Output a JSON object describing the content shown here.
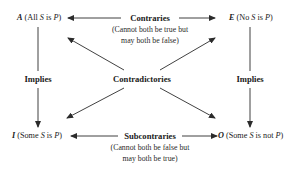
{
  "diagram": {
    "corners": {
      "A": {
        "letter": "A",
        "open": " (All ",
        "s": "S",
        "mid": " is ",
        "p": "P",
        "close": ")"
      },
      "E": {
        "letter": "E",
        "open": " (No ",
        "s": "S",
        "mid": " is ",
        "p": "P",
        "close": ")"
      },
      "I": {
        "letter": "I",
        "open": " (Some ",
        "s": "S",
        "mid": " is ",
        "p": "P",
        "close": ")"
      },
      "O": {
        "letter": "O",
        "open": " (Some ",
        "s": "S",
        "mid": " is not ",
        "p": "P",
        "close": ")"
      }
    },
    "relations": {
      "contraries": {
        "label": "Contraries",
        "line1": "(Cannot both be true but",
        "line2": "may both be false)"
      },
      "subcontraries": {
        "label": "Subcontraries",
        "line1": "(Cannot both be false but",
        "line2": "may both be true)"
      },
      "contradictories": {
        "label": "Contradictories"
      },
      "implies_left": {
        "label": "Implies"
      },
      "implies_right": {
        "label": "Implies"
      }
    },
    "colors": {
      "line": "#2b2b2b",
      "text": "#1a1a1a",
      "background": "#ffffff"
    }
  }
}
